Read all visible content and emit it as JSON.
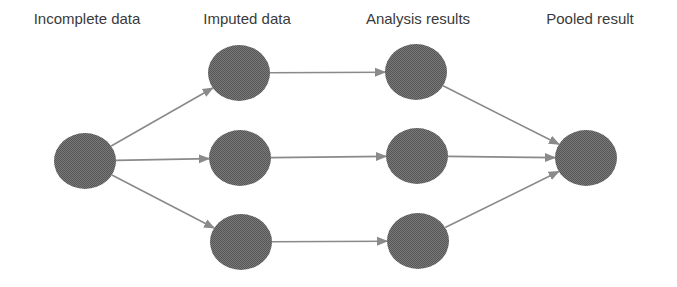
{
  "diagram": {
    "columns": [
      {
        "id": "incomplete",
        "label": "Incomplete data",
        "x": 87
      },
      {
        "id": "imputed",
        "label": "Imputed data",
        "x": 247
      },
      {
        "id": "analysis",
        "label": "Analysis results",
        "x": 418
      },
      {
        "id": "pooled",
        "label": "Pooled result",
        "x": 590
      }
    ],
    "node_color": "#6b6b6b",
    "edge_color": "#8a8a8a",
    "nodes": [
      {
        "id": "incomplete-1",
        "column": "incomplete",
        "cx": 85,
        "cy": 161
      },
      {
        "id": "imputed-1",
        "column": "imputed",
        "cx": 239,
        "cy": 73
      },
      {
        "id": "imputed-2",
        "column": "imputed",
        "cx": 240,
        "cy": 158
      },
      {
        "id": "imputed-3",
        "column": "imputed",
        "cx": 241,
        "cy": 242
      },
      {
        "id": "analysis-1",
        "column": "analysis",
        "cx": 416,
        "cy": 72
      },
      {
        "id": "analysis-2",
        "column": "analysis",
        "cx": 417,
        "cy": 156
      },
      {
        "id": "analysis-3",
        "column": "analysis",
        "cx": 418,
        "cy": 241
      },
      {
        "id": "pooled-1",
        "column": "pooled",
        "cx": 586,
        "cy": 158
      }
    ],
    "edges": [
      {
        "from": "incomplete-1",
        "to": "imputed-1"
      },
      {
        "from": "incomplete-1",
        "to": "imputed-2"
      },
      {
        "from": "incomplete-1",
        "to": "imputed-3"
      },
      {
        "from": "imputed-1",
        "to": "analysis-1"
      },
      {
        "from": "imputed-2",
        "to": "analysis-2"
      },
      {
        "from": "imputed-3",
        "to": "analysis-3"
      },
      {
        "from": "analysis-1",
        "to": "pooled-1"
      },
      {
        "from": "analysis-2",
        "to": "pooled-1"
      },
      {
        "from": "analysis-3",
        "to": "pooled-1"
      }
    ]
  }
}
